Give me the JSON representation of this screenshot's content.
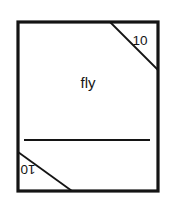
{
  "figure": {
    "type": "sewing-pattern-diagram",
    "piece_label": "fly",
    "corner_labels": [
      {
        "text": "10",
        "position": "top-right",
        "rotation": 0
      },
      {
        "text": "10",
        "position": "bottom-left",
        "rotation": 180
      }
    ],
    "colors": {
      "background": "#ffffff",
      "outline": "#141414",
      "fill": "#ffffff",
      "inner_line": "#141414",
      "text": "#141414"
    },
    "geometry": {
      "outline_rect": {
        "x": 18,
        "y": 22,
        "width": 140,
        "height": 169
      },
      "outline_stroke_width": 3.2,
      "horizontal_line": {
        "x1": 24,
        "y1": 140,
        "x2": 150,
        "y2": 140
      },
      "horizontal_line_stroke_width": 1.8,
      "diagonal_top_right": {
        "x1": 110,
        "y1": 22,
        "x2": 158,
        "y2": 70
      },
      "diagonal_bottom_left": {
        "x1": 18,
        "y1": 152,
        "x2": 72,
        "y2": 191
      },
      "diagonal_stroke_width": 1.8,
      "piece_label_anchor": {
        "x": 88,
        "y": 88
      },
      "corner_label_top_right_anchor": {
        "x": 140,
        "y": 45
      },
      "corner_label_bottom_left_anchor": {
        "x": 28,
        "y": 175
      }
    }
  }
}
